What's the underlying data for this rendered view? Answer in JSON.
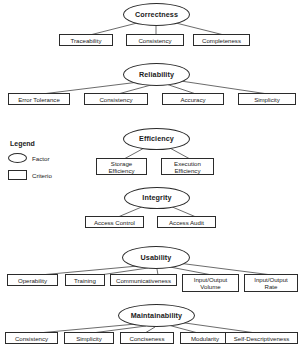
{
  "diagram": {
    "type": "hierarchy",
    "legend": {
      "title": "Legend",
      "items": [
        {
          "shape": "ellipse",
          "label": "Factor",
          "icon": "ellipse-icon"
        },
        {
          "shape": "rectangle",
          "label": "Criterio",
          "icon": "rectangle-icon"
        }
      ]
    },
    "groups": [
      {
        "factor": "Correctness",
        "criteria": [
          "Traceability",
          "Consistency",
          "Completeness"
        ]
      },
      {
        "factor": "Reliability",
        "criteria": [
          "Error Tolerance",
          "Consistency",
          "Accuracy",
          "Simplicity"
        ]
      },
      {
        "factor": "Efficiency",
        "criteria": [
          "Storage\nEfficiency",
          "Execution\nEfficiency"
        ]
      },
      {
        "factor": "Integrity",
        "criteria": [
          "Access Control",
          "Access Audit"
        ]
      },
      {
        "factor": "Usability",
        "criteria": [
          "Operability",
          "Training",
          "Communicativeness",
          "Input/Output\nVolume",
          "Input/Output\nRate"
        ]
      },
      {
        "factor": "Maintainability",
        "criteria": [
          "Consistency",
          "Simplicity",
          "Conciseness",
          "Modularity",
          "Self-Descriptiveness"
        ]
      }
    ]
  },
  "colors": {
    "stroke": "#2b2b2b",
    "background": "#ffffff",
    "text": "#1a1a1a"
  }
}
